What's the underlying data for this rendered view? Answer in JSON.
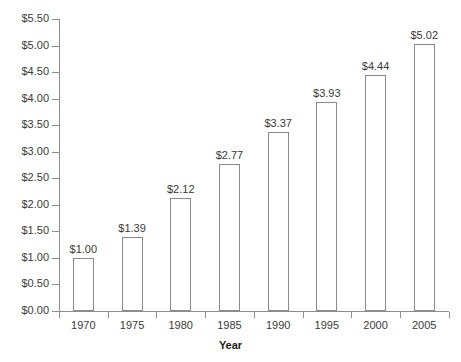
{
  "chart_data": {
    "type": "bar",
    "title": "",
    "xlabel": "Year",
    "ylabel": "",
    "categories": [
      "1970",
      "1975",
      "1980",
      "1985",
      "1990",
      "1995",
      "2000",
      "2005"
    ],
    "values": [
      1.0,
      1.39,
      2.12,
      2.77,
      3.37,
      3.93,
      4.44,
      5.02
    ],
    "data_labels": [
      "$1.00",
      "$1.39",
      "$2.12",
      "$2.77",
      "$3.37",
      "$3.93",
      "$4.44",
      "$5.02"
    ],
    "ylim": [
      0,
      5.5
    ],
    "ytick_values": [
      0,
      0.5,
      1.0,
      1.5,
      2.0,
      2.5,
      3.0,
      3.5,
      4.0,
      4.5,
      5.0,
      5.5
    ],
    "ytick_labels": [
      "$0.00",
      "$0.50",
      "$1.00",
      "$1.50",
      "$2.00",
      "$2.50",
      "$3.00",
      "$3.50",
      "$4.00",
      "$4.50",
      "$5.00",
      "$5.50"
    ],
    "grid": false,
    "legend": false,
    "bar_fill": "#ffffff",
    "bar_border": "#8a8a8a",
    "axis_color": "#8d8d8d",
    "text_color": "#3a3a3a"
  }
}
